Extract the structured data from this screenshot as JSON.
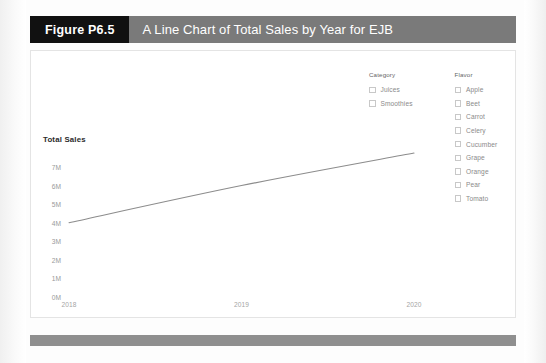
{
  "figure": {
    "badge_label": "Figure P6.5",
    "title": "A Line Chart of Total Sales by Year for EJB"
  },
  "legend": {
    "groups": [
      {
        "heading": "Category",
        "items": [
          {
            "label": "Juices",
            "checked": false
          },
          {
            "label": "Smoothies",
            "checked": false
          }
        ]
      },
      {
        "heading": "Flavor",
        "items": [
          {
            "label": "Apple",
            "checked": false
          },
          {
            "label": "Beet",
            "checked": false
          },
          {
            "label": "Carrot",
            "checked": false
          },
          {
            "label": "Celery",
            "checked": false
          },
          {
            "label": "Cucumber",
            "checked": false
          },
          {
            "label": "Grape",
            "checked": false
          },
          {
            "label": "Orange",
            "checked": false
          },
          {
            "label": "Pear",
            "checked": false
          },
          {
            "label": "Tomato",
            "checked": false
          }
        ]
      }
    ]
  },
  "colors": {
    "badge_background": "#111111",
    "title_background": "#7a7a7a",
    "title_text": "#ffffff",
    "footer_bar": "#8f8f8f",
    "line": "#8c8c8c",
    "axis_text": "#999999",
    "axis_title_text": "#2b2b2b",
    "panel_border": "#e4e4e4"
  },
  "chart_data": {
    "type": "line",
    "title": "A Line Chart of Total Sales by Year for EJB",
    "xlabel": "",
    "ylabel": "Total Sales",
    "x": [
      "2018",
      "2019",
      "2020"
    ],
    "categories": [
      "2018",
      "2019",
      "2020"
    ],
    "values": [
      4.0,
      6.0,
      7.75
    ],
    "series": [
      {
        "name": "Total Sales",
        "values": [
          4.0,
          6.0,
          7.75
        ]
      }
    ],
    "ylim": [
      0,
      7
    ],
    "y_tick_labels": [
      "7M",
      "6M",
      "5M",
      "4M",
      "3M",
      "2M",
      "1M",
      "0M"
    ],
    "y_tick_values": [
      7,
      6,
      5,
      4,
      3,
      2,
      1,
      0
    ],
    "x_tick_labels": [
      "2018",
      "2019",
      "2020"
    ],
    "value_unit": "M",
    "grid": false,
    "legend_position": "top-right",
    "legend_filters": [
      "Category",
      "Flavor"
    ]
  }
}
